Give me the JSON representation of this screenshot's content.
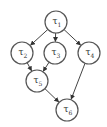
{
  "diagram": {
    "type": "directed-acyclic-graph",
    "nodes": [
      {
        "id": "t1",
        "label": "τ",
        "sub": "1"
      },
      {
        "id": "t2",
        "label": "τ",
        "sub": "2"
      },
      {
        "id": "t3",
        "label": "τ",
        "sub": "3"
      },
      {
        "id": "t4",
        "label": "τ",
        "sub": "4"
      },
      {
        "id": "t5",
        "label": "τ",
        "sub": "5"
      },
      {
        "id": "t6",
        "label": "τ",
        "sub": "6"
      }
    ],
    "edges": [
      {
        "from": "t1",
        "to": "t2"
      },
      {
        "from": "t1",
        "to": "t3"
      },
      {
        "from": "t1",
        "to": "t4"
      },
      {
        "from": "t2",
        "to": "t5"
      },
      {
        "from": "t3",
        "to": "t5"
      },
      {
        "from": "t5",
        "to": "t6"
      },
      {
        "from": "t4",
        "to": "t6"
      }
    ],
    "colors": {
      "stroke": "#555555",
      "text": "#333333",
      "background": "#ffffff"
    }
  }
}
